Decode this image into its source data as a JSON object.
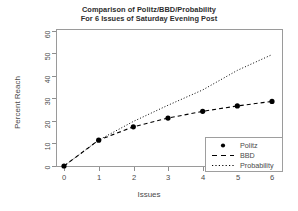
{
  "chart_data": {
    "type": "line",
    "title": "Comparison of Politz/BBD/Probability",
    "subtitle": "For 6 Issues of Saturday Evening Post",
    "title_line1": "Comparison of Politz/BBD/Probability",
    "title_line2": "For 6 Issues of Saturday Evening Post",
    "xlabel": "Issues",
    "ylabel": "Percent Reach",
    "x": [
      0,
      1,
      2,
      3,
      4,
      5,
      6
    ],
    "xlim": [
      0,
      6
    ],
    "ylim": [
      0,
      60
    ],
    "xticks": [
      "0",
      "1",
      "2",
      "3",
      "4",
      "5",
      "6"
    ],
    "yticks": [
      "0",
      "10",
      "20",
      "30",
      "40",
      "50",
      "60"
    ],
    "grid": false,
    "legend_position": "bottom-right",
    "series": [
      {
        "name": "Politz",
        "style": "points",
        "marker": "filled-circle",
        "color": "#000000",
        "values": [
          0,
          11.5,
          17.4,
          21.3,
          24.3,
          26.7,
          28.7
        ]
      },
      {
        "name": "BBD",
        "style": "dashed",
        "color": "#000000",
        "values": [
          0,
          11.5,
          17.4,
          21.3,
          24.3,
          26.7,
          28.7
        ]
      },
      {
        "name": "Probability",
        "style": "dotted",
        "color": "#000000",
        "values": [
          0,
          11.5,
          19.8,
          27.0,
          33.8,
          42.5,
          49.5
        ]
      }
    ]
  },
  "legend": {
    "items": [
      {
        "label": "Politz",
        "key": "filled-circle-marker"
      },
      {
        "label": "BBD",
        "key": "dashed-line"
      },
      {
        "label": "Probability",
        "key": "dotted-line"
      }
    ]
  }
}
